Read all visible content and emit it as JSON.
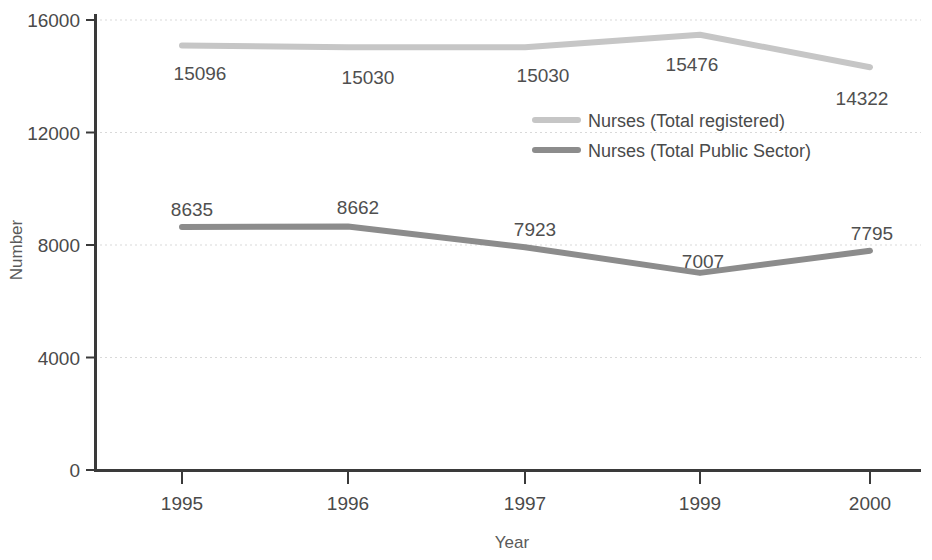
{
  "chart_data": {
    "type": "line",
    "title": "",
    "xlabel": "Year",
    "ylabel": "Number",
    "categories": [
      "1995",
      "1996",
      "1997",
      "1999",
      "2000"
    ],
    "ylim": [
      0,
      16000
    ],
    "yticks": [
      "0",
      "4000",
      "8000",
      "12000",
      "16000"
    ],
    "grid": true,
    "legend_position": "center",
    "series": [
      {
        "name": "Nurses (Total registered)",
        "color": "#c6c6c6",
        "values": [
          15096,
          15030,
          15030,
          15476,
          14322
        ],
        "labels": [
          "15096",
          "15030",
          "15030",
          "15476",
          "14322"
        ]
      },
      {
        "name": "Nurses (Total Public Sector)",
        "color": "#8c8c8c",
        "values": [
          8635,
          8662,
          7923,
          7007,
          7795
        ],
        "labels": [
          "8635",
          "8662",
          "7923",
          "7007",
          "7795"
        ]
      }
    ]
  },
  "axis": {
    "y_title": "Number",
    "x_title": "Year",
    "y_tick_0": "0",
    "y_tick_1": "4000",
    "y_tick_2": "8000",
    "y_tick_3": "12000",
    "y_tick_4": "16000",
    "x_tick_0": "1995",
    "x_tick_1": "1996",
    "x_tick_2": "1997",
    "x_tick_3": "1999",
    "x_tick_4": "2000"
  },
  "legend": {
    "entry_0": "Nurses (Total registered)",
    "entry_1": "Nurses (Total Public Sector)"
  },
  "labels": {
    "registered_0": "15096",
    "registered_1": "15030",
    "registered_2": "15030",
    "registered_3": "15476",
    "registered_4": "14322",
    "public_0": "8635",
    "public_1": "8662",
    "public_2": "7923",
    "public_3": "7007",
    "public_4": "7795"
  },
  "colors": {
    "series_registered": "#c6c6c6",
    "series_public": "#8c8c8c",
    "axis": "#3a3a3a",
    "grid": "#d8d8d8",
    "text": "#4a4a4a"
  }
}
